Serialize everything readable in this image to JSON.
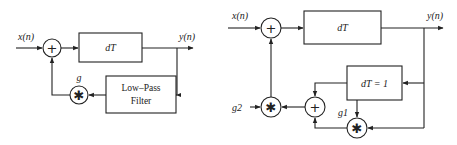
{
  "diagram_left": {
    "input_label": "x(n)",
    "output_label": "y(n)",
    "delay_block": "dT",
    "filter_block": {
      "line1": "Low–Pass",
      "line2": "Filter"
    },
    "gain_label": "g",
    "sum_symbol": "+",
    "mult_symbol": "✱"
  },
  "diagram_right": {
    "input_label": "x(n)",
    "output_label": "y(n)",
    "delay_block": "dT",
    "unit_delay_block": "dT = 1",
    "gain1_label": "g1",
    "gain2_label": "g2",
    "sum_symbol": "+",
    "mult_symbol": "✱"
  }
}
